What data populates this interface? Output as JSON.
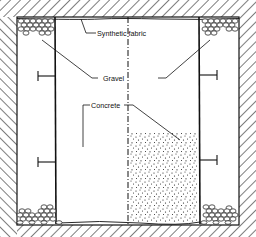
{
  "diagram": {
    "type": "cross-section",
    "labels": {
      "fabric": "Synthetic fabric",
      "gravel": "Gravel",
      "concrete": "Concrete"
    },
    "colors": {
      "line": "#111111",
      "background": "#ffffff"
    }
  }
}
